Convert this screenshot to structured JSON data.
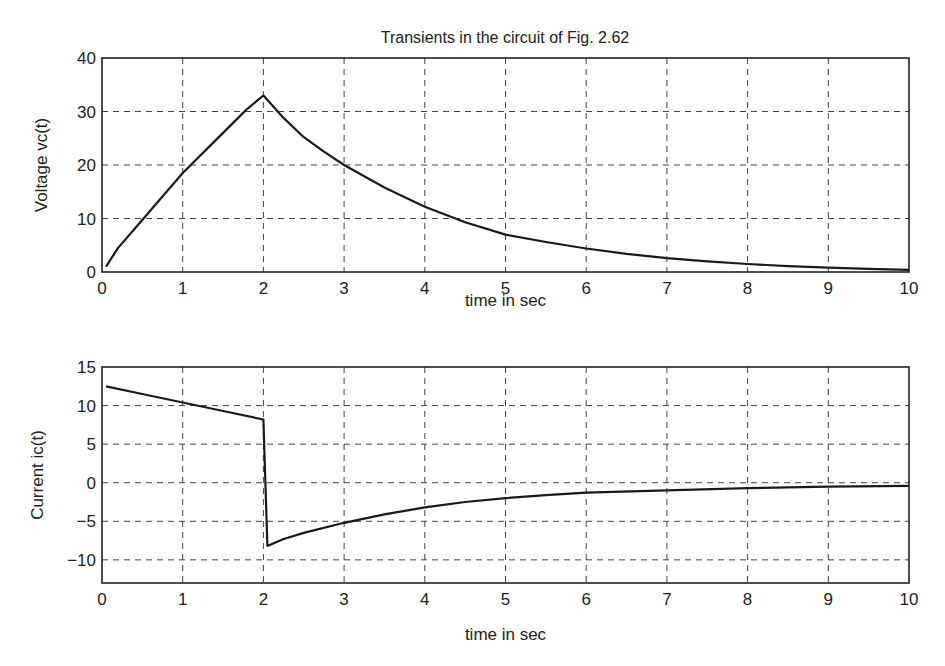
{
  "chart_data": [
    {
      "type": "line",
      "title": "Transients in the circuit of Fig. 2.62",
      "xlabel": "time in sec",
      "ylabel": "Voltage vc(t)",
      "xlim": [
        0,
        10
      ],
      "ylim": [
        0,
        40
      ],
      "xticks": [
        "0",
        "1",
        "2",
        "3",
        "4",
        "5",
        "6",
        "7",
        "8",
        "9",
        "10"
      ],
      "yticks": [
        "0",
        "10",
        "20",
        "30",
        "40"
      ],
      "grid": true,
      "series": [
        {
          "name": "vc(t)",
          "x": [
            0.05,
            0.2,
            0.4,
            0.6,
            0.8,
            1.0,
            1.2,
            1.4,
            1.6,
            1.8,
            2.0,
            2.25,
            2.5,
            2.75,
            3.0,
            3.5,
            4.0,
            4.5,
            5.0,
            5.5,
            6.0,
            6.5,
            7.0,
            7.5,
            8.0,
            8.5,
            9.0,
            9.5,
            10.0
          ],
          "y": [
            1.0,
            4.5,
            8.0,
            11.5,
            15.0,
            18.5,
            21.5,
            24.5,
            27.5,
            30.5,
            33.0,
            28.8,
            25.2,
            22.5,
            20.0,
            15.8,
            12.2,
            9.3,
            7.0,
            5.6,
            4.4,
            3.4,
            2.6,
            2.0,
            1.5,
            1.1,
            0.8,
            0.6,
            0.4
          ]
        }
      ]
    },
    {
      "type": "line",
      "title": "",
      "xlabel": "time in sec",
      "ylabel": "Current ic(t)",
      "xlim": [
        0,
        10
      ],
      "ylim": [
        -13,
        15
      ],
      "xticks": [
        "0",
        "1",
        "2",
        "3",
        "4",
        "5",
        "6",
        "7",
        "8",
        "9",
        "10"
      ],
      "yticks": [
        "15",
        "10",
        "5",
        "0",
        "−10",
        "−5"
      ],
      "ytick_values": [
        15,
        10,
        5,
        0,
        -10,
        -5
      ],
      "grid": true,
      "series": [
        {
          "name": "ic(t)",
          "x": [
            0.05,
            0.5,
            1.0,
            1.5,
            2.0,
            2.05,
            2.25,
            2.5,
            3.0,
            3.5,
            4.0,
            4.5,
            5.0,
            5.5,
            6.0,
            7.0,
            8.0,
            9.0,
            10.0
          ],
          "y": [
            12.5,
            11.5,
            10.4,
            9.3,
            8.2,
            -8.2,
            -7.3,
            -6.5,
            -5.2,
            -4.1,
            -3.2,
            -2.5,
            -2.0,
            -1.6,
            -1.3,
            -1.0,
            -0.7,
            -0.5,
            -0.4
          ]
        }
      ]
    }
  ]
}
